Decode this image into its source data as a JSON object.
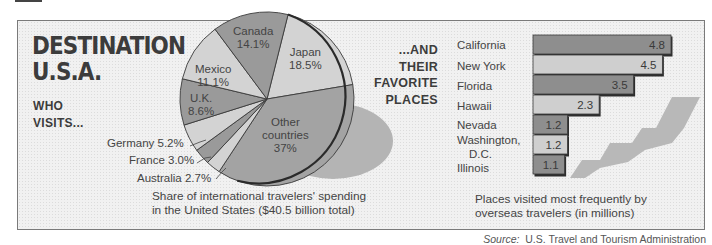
{
  "header": {
    "title_line1": "DESTINATION",
    "title_line2": "U.S.A.",
    "left_subtitle": "WHO\nVISITS...",
    "right_subtitle": "...AND\nTHEIR\nFAVORITE\nPLACES"
  },
  "pie": {
    "caption": "Share of international travelers' spending\nin the United States ($40.5 billion total)",
    "slices": [
      {
        "label": "Japan",
        "value_label": "18.5%",
        "value": 18.5,
        "color": "#d3d3d3"
      },
      {
        "label": "Other countries",
        "value_label": "37%",
        "value": 37.0,
        "color": "#a3a3a3"
      },
      {
        "label": "Australia",
        "value_label": "2.7%",
        "value": 2.7,
        "color": "#d3d3d3"
      },
      {
        "label": "France",
        "value_label": "3.0%",
        "value": 3.0,
        "color": "#9a9a9a"
      },
      {
        "label": "Germany",
        "value_label": "5.2%",
        "value": 5.2,
        "color": "#d3d3d3"
      },
      {
        "label": "U.K.",
        "value_label": "8.6%",
        "value": 8.6,
        "color": "#9a9a9a"
      },
      {
        "label": "Mexico",
        "value_label": "11.1%",
        "value": 11.1,
        "color": "#d3d3d3"
      },
      {
        "label": "Canada",
        "value_label": "14.1%",
        "value": 14.1,
        "color": "#9a9a9a"
      }
    ],
    "outside_labels": {
      "germany": "Germany 5.2%",
      "france": "France 3.0%",
      "australia": "Australia 2.7%"
    },
    "inside_labels": {
      "canada": [
        "Canada",
        "14.1%"
      ],
      "japan": [
        "Japan",
        "18.5%"
      ],
      "mexico": [
        "Mexico",
        "11.1%"
      ],
      "uk": [
        "U.K.",
        "8.6%"
      ],
      "other": [
        "Other",
        "countries",
        "37%"
      ]
    }
  },
  "bars": {
    "caption": "Places visited most frequently by\noverseas travelers (in millions)",
    "labels": {
      "california": "California",
      "new_york": "New York",
      "florida": "Florida",
      "hawaii": "Hawaii",
      "nevada": "Nevada",
      "washington_1": "Washington,",
      "washington_2": "D.C.",
      "illinois": "Illinois"
    },
    "items": [
      {
        "label": "California",
        "value": 4.8,
        "value_label": "4.8"
      },
      {
        "label": "New York",
        "value": 4.5,
        "value_label": "4.5"
      },
      {
        "label": "Florida",
        "value": 3.5,
        "value_label": "3.5"
      },
      {
        "label": "Hawaii",
        "value": 2.3,
        "value_label": "2.3"
      },
      {
        "label": "Nevada",
        "value": 1.2,
        "value_label": "1.2"
      },
      {
        "label": "Washington, D.C.",
        "value": 1.2,
        "value_label": "1.2"
      },
      {
        "label": "Illinois",
        "value": 1.1,
        "value_label": "1.1"
      }
    ]
  },
  "source": {
    "prefix": "Source:",
    "text": "  U.S. Travel and Tourism Administration"
  },
  "colors": {
    "dark_bar": "#8e8e8e",
    "light_bar": "#cfcfcf",
    "shadow": "#b4b4b4",
    "text": "#3c3c3c"
  },
  "chart_data": [
    {
      "type": "pie",
      "title": "DESTINATION U.S.A. — Who visits...",
      "caption": "Share of international travelers' spending in the United States ($40.5 billion total)",
      "categories": [
        "Japan",
        "Other countries",
        "Australia",
        "France",
        "Germany",
        "U.K.",
        "Mexico",
        "Canada"
      ],
      "values": [
        18.5,
        37,
        2.7,
        3.0,
        5.2,
        8.6,
        11.1,
        14.1
      ],
      "unit": "%",
      "legend": "none (direct labels)"
    },
    {
      "type": "bar",
      "orientation": "horizontal",
      "title": "...and their favorite places",
      "caption": "Places visited most frequently by overseas travelers (in millions)",
      "categories": [
        "California",
        "New York",
        "Florida",
        "Hawaii",
        "Nevada",
        "Washington, D.C.",
        "Illinois"
      ],
      "values": [
        4.8,
        4.5,
        3.5,
        2.3,
        1.2,
        1.2,
        1.1
      ],
      "xlabel": "",
      "ylabel": "",
      "xlim": [
        0,
        4.8
      ],
      "grid": false,
      "data_labels": true
    }
  ]
}
